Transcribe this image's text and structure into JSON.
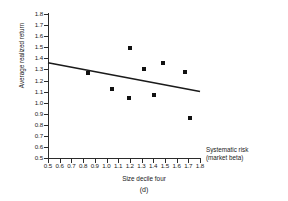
{
  "chart_data": {
    "type": "scatter",
    "title": "",
    "subtitle": "",
    "panel_label": "(d)",
    "group_label": "Size decile four",
    "xlabel": "Systematic risk",
    "xlabel_line2": "(market beta)",
    "ylabel": "Average realized return",
    "xlim": [
      0.5,
      1.8
    ],
    "ylim": [
      0.5,
      1.8
    ],
    "xticks": [
      "0.5",
      "0.6",
      "0.7",
      "0.8",
      "0.9",
      "1.0",
      "1.1",
      "1.2",
      "1.3",
      "1.4",
      "1.5",
      "1.6",
      "1.7",
      "1.8"
    ],
    "xtick_values": [
      0.5,
      0.6,
      0.7,
      0.8,
      0.9,
      1.0,
      1.1,
      1.2,
      1.3,
      1.4,
      1.5,
      1.6,
      1.7,
      1.8
    ],
    "yticks": [
      "1.8",
      "1.7",
      "1.6",
      "1.5",
      "1.4",
      "1.3",
      "1.2",
      "1.1",
      "1.0",
      "0.9",
      "0.8",
      "0.7",
      "0.6",
      "0.5"
    ],
    "ytick_values": [
      1.8,
      1.7,
      1.6,
      1.5,
      1.4,
      1.3,
      1.2,
      1.1,
      1.0,
      0.9,
      0.8,
      0.7,
      0.6,
      0.5
    ],
    "grid": false,
    "legend": false,
    "marker": "filled-square",
    "marker_color": "#111111",
    "points": [
      {
        "x": 0.84,
        "y": 1.27
      },
      {
        "x": 1.05,
        "y": 1.12
      },
      {
        "x": 1.19,
        "y": 1.04
      },
      {
        "x": 1.2,
        "y": 1.49
      },
      {
        "x": 1.32,
        "y": 1.3
      },
      {
        "x": 1.41,
        "y": 1.07
      },
      {
        "x": 1.48,
        "y": 1.36
      },
      {
        "x": 1.67,
        "y": 1.28
      },
      {
        "x": 1.71,
        "y": 0.86
      }
    ],
    "trendline": {
      "type": "linear-fit",
      "color": "#1a1a1a",
      "x_start": 0.5,
      "y_start": 1.36,
      "x_end": 1.8,
      "y_end": 1.1
    },
    "axis_color": "#2b2b2b",
    "background": "#ffffff"
  }
}
